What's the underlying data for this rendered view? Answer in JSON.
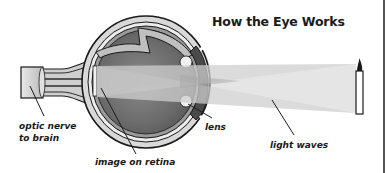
{
  "title": "How the Eye Works",
  "labels": {
    "optic_nerve_line1": "optic nerve",
    "optic_nerve_line2": "to brain",
    "image_on_retina": "image on retina",
    "lens": "lens",
    "light_waves": "light waves"
  },
  "colors": {
    "outline": "#1a1a1a",
    "sclera": "#d9d9d9",
    "choroid": "#9a9a9a",
    "interior_dark": "#6a6a6a",
    "interior_light": "#bdbdbd",
    "light_beam": "#cfcfcf",
    "light_beam_inner": "#a8a8a8"
  },
  "elements": {
    "eye_icon": "eye-cross-section",
    "candle_icon": "candle",
    "optic_nerve_icon": "optic-nerve"
  }
}
